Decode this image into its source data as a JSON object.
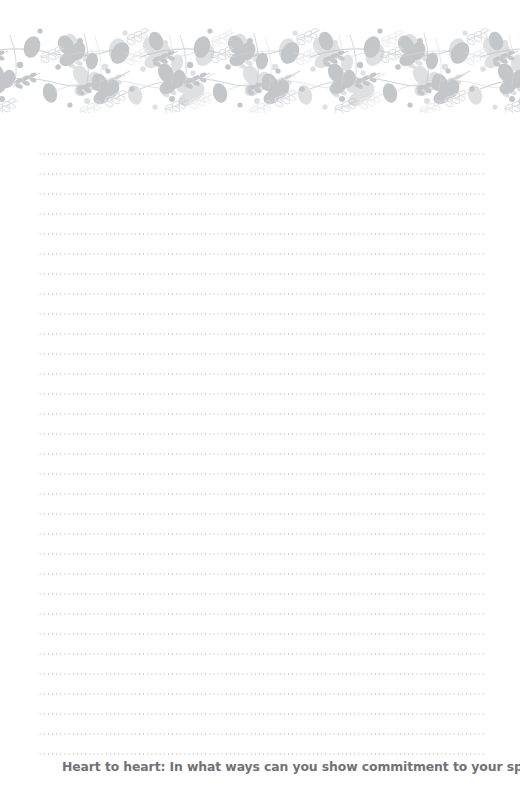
{
  "page": {
    "type": "lined-journal-page",
    "background_color": "#ffffff",
    "width": 520,
    "height": 799
  },
  "header": {
    "decoration_name": "floral-vine-border",
    "ink_color": "#c4c7ca",
    "outline_color": "#dcdee0",
    "top": 27,
    "height": 86
  },
  "writing_area": {
    "line_style": "dotted",
    "line_color": "#c9cbce",
    "line_count": 31,
    "line_spacing_px": 20,
    "left_px": 38,
    "right_px": 486,
    "first_line_top_px": 153
  },
  "footer": {
    "prompt_label": "Heart to heart:",
    "prompt_question": "In what ways can you show commitment to your spouse?",
    "prompt_full": "Heart to heart:  In what ways can you show commitment to your spouse?",
    "text_color": "#6f7276"
  }
}
